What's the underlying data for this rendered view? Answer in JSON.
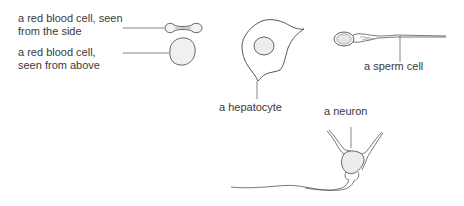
{
  "diagram": {
    "type": "cell-types-illustration",
    "colors": {
      "stroke": "#555555",
      "fill": "#ececec",
      "text": "#3a3a3a",
      "background": "#ffffff"
    },
    "labels": {
      "rbc_side_line1": "a red blood cell, seen",
      "rbc_side_line2": "from the side",
      "rbc_above_line1": "a red blood cell,",
      "rbc_above_line2": "seen from above",
      "hepatocyte": "a hepatocyte",
      "sperm": "a sperm cell",
      "neuron": "a neuron"
    },
    "cells": [
      {
        "id": "rbc-side",
        "label": "a red blood cell, seen from the side"
      },
      {
        "id": "rbc-above",
        "label": "a red blood cell, seen from above"
      },
      {
        "id": "hepatocyte",
        "label": "a hepatocyte"
      },
      {
        "id": "sperm",
        "label": "a sperm cell"
      },
      {
        "id": "neuron",
        "label": "a neuron"
      }
    ]
  }
}
